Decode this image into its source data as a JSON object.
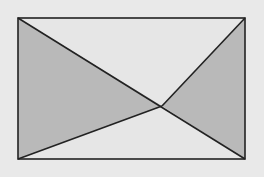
{
  "figure": {
    "colors": {
      "background": "#e9e9e9",
      "shade": "#b9b9b9",
      "unshaded": "#e6e6e6",
      "stroke": "#222222"
    },
    "rectangle": {
      "x1": 18,
      "y1": 18,
      "x2": 245,
      "y2": 159
    },
    "intersection_point": {
      "x": 162,
      "y": 106
    },
    "shaded_regions": [
      {
        "name": "left-triangle",
        "vertices": [
          [
            18,
            18
          ],
          [
            162,
            106
          ],
          [
            18,
            159
          ]
        ]
      },
      {
        "name": "right-triangle",
        "vertices": [
          [
            245,
            18
          ],
          [
            245,
            159
          ],
          [
            162,
            106
          ]
        ]
      }
    ]
  }
}
